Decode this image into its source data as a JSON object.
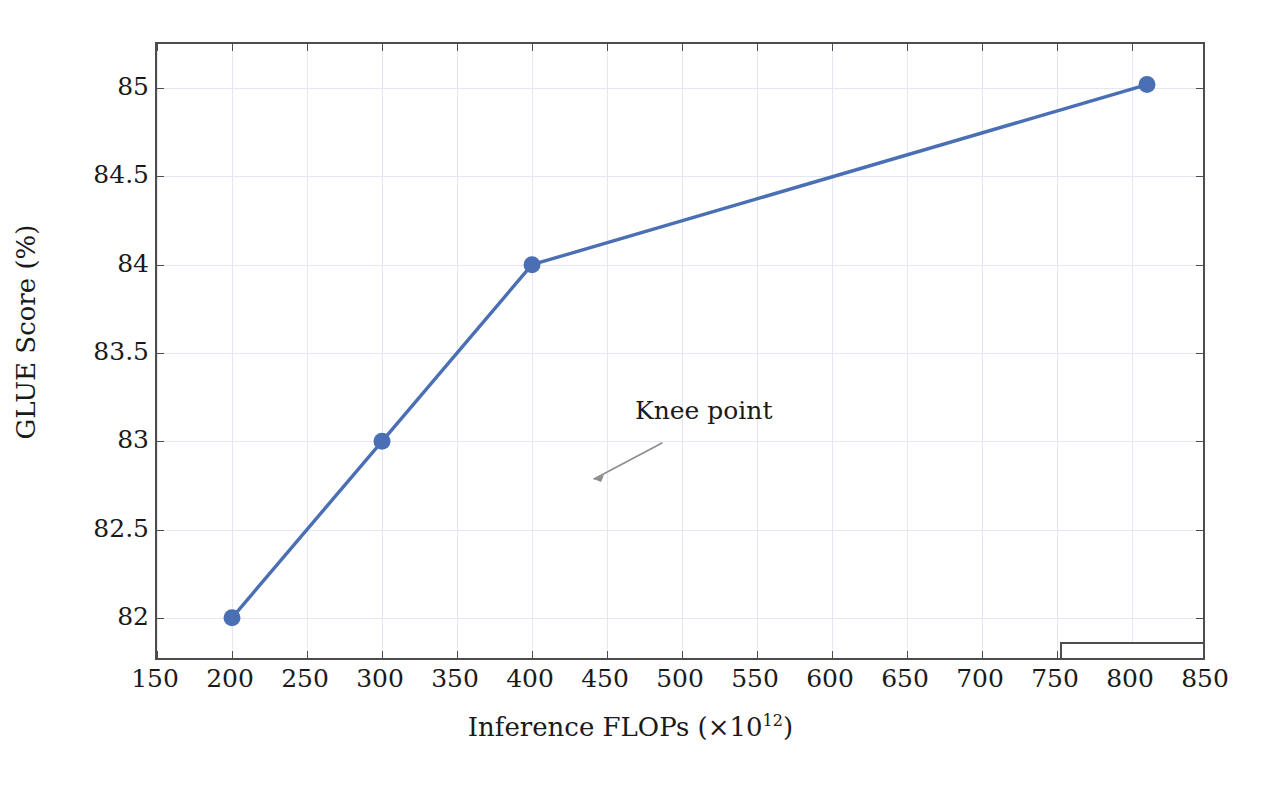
{
  "chart_data": {
    "type": "line",
    "title": "",
    "xlabel": "Inference FLOPs (×10¹²)",
    "xlabel_base": "Inference FLOPs (×10",
    "xlabel_exponent": "12",
    "xlabel_tail": ")",
    "ylabel": "GLUE Score (%)",
    "xlim": [
      150,
      850
    ],
    "ylim": [
      81.75,
      85.25
    ],
    "xticks": [
      150,
      200,
      250,
      300,
      350,
      400,
      450,
      500,
      550,
      600,
      650,
      700,
      750,
      800,
      850
    ],
    "xticklabels": [
      "150",
      "200",
      "250",
      "300",
      "350",
      "400",
      "450",
      "500",
      "550",
      "600",
      "650",
      "700",
      "750",
      "800",
      "850"
    ],
    "yticks": [
      82,
      82.5,
      83,
      83.5,
      84,
      84.5,
      85
    ],
    "yticklabels": [
      "82",
      "82.5",
      "83",
      "83.5",
      "84",
      "84.5",
      "85"
    ],
    "grid": true,
    "legend_position": "lower right",
    "series": [
      {
        "name": "Model Variants",
        "color": "#4a6fb5",
        "marker": "circle",
        "x": [
          200,
          300,
          400,
          810
        ],
        "y": [
          82.0,
          83.0,
          84.0,
          85.02
        ],
        "points": [
          {
            "x": 200,
            "y": 82.0
          },
          {
            "x": 300,
            "y": 83.0
          },
          {
            "x": 400,
            "y": 84.0
          },
          {
            "x": 810,
            "y": 85.02
          }
        ]
      }
    ],
    "annotations": [
      {
        "text": "Knee point",
        "text_x": 372,
        "text_y": 83.55,
        "arrow_from_x": 386,
        "arrow_from_y": 83.37,
        "arrow_to_x": 341,
        "arrow_to_y": 83.17,
        "color": "#8c8c8c"
      }
    ]
  },
  "legend": {
    "entries": [
      {
        "label": "Model Variants",
        "color": "#4a6fb5"
      }
    ]
  },
  "colors": {
    "series_blue": "#4a6fb5",
    "axis": "#4d4d4d",
    "grid": "#e3e7ef",
    "annotation_gray": "#8c8c8c",
    "background": "#ffffff",
    "text": "#1a1a1a"
  }
}
